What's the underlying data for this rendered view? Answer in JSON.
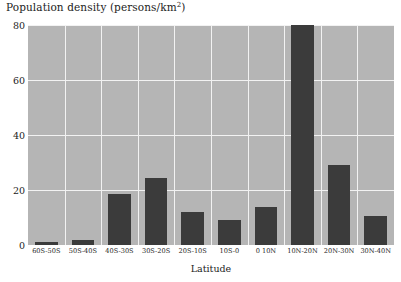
{
  "chart_data": {
    "type": "bar",
    "title_main": "Population density (persons/km",
    "title_sup": "2",
    "title_tail": ")",
    "xlabel": "Latitude",
    "ylabel": "",
    "categories": [
      "60S-50S",
      "50S-40S",
      "40S-30S",
      "30S-20S",
      "20S-10S",
      "10S-0",
      "0 10N",
      "10N-20N",
      "20N-30N",
      "30N-40N"
    ],
    "values": [
      1,
      2,
      18.5,
      24.5,
      12,
      9,
      14,
      80,
      29,
      10.5
    ],
    "ylim": [
      0,
      80
    ],
    "yticks": [
      0,
      20,
      40,
      60,
      80
    ],
    "ytick_labels": [
      "0",
      "20",
      "40",
      "60",
      "80"
    ],
    "grid": true,
    "legend": "none",
    "bar_color": "#3b3b3b",
    "plot_background": "#b5b5b5",
    "gridline_color": "#f2f2f2",
    "page_background": "#ffffff"
  }
}
